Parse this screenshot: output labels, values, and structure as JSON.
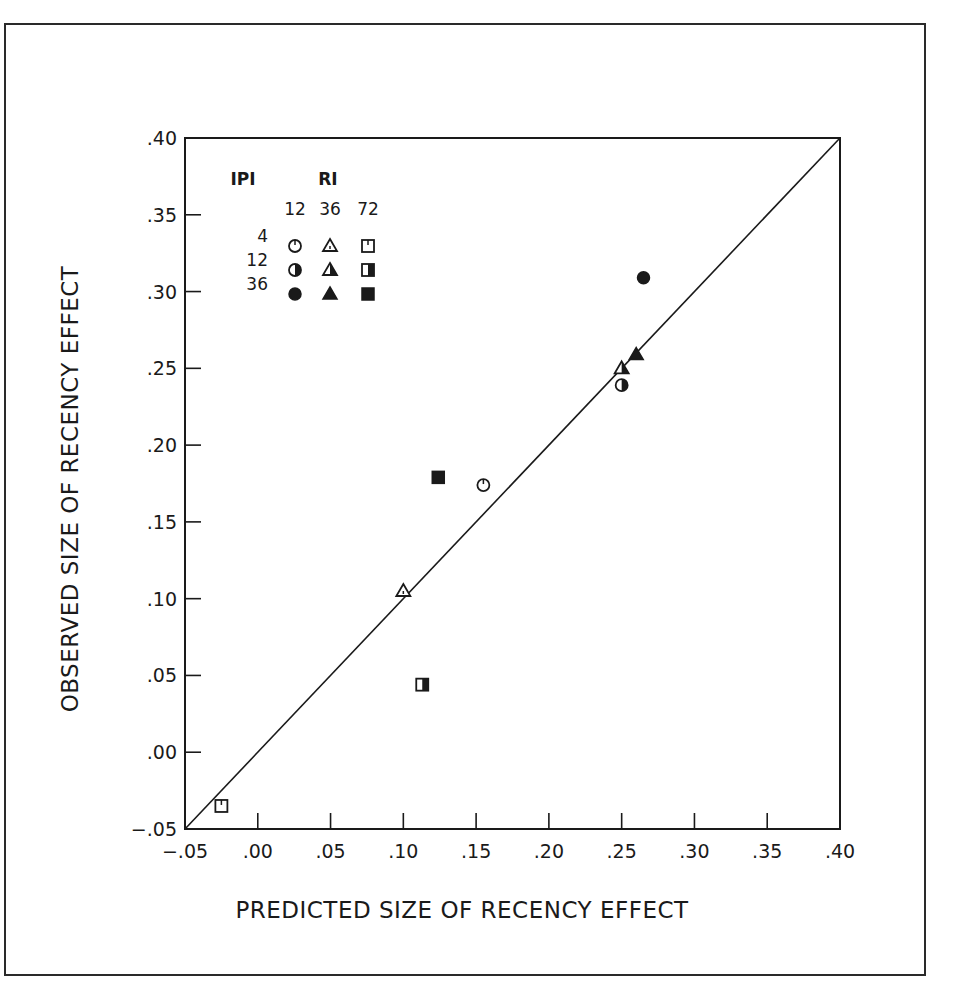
{
  "chart_data": {
    "type": "scatter",
    "title": "",
    "xlabel": "PREDICTED SIZE OF RECENCY EFFECT",
    "ylabel": "OBSERVED SIZE OF RECENCY EFFECT",
    "xlim": [
      -0.05,
      0.4
    ],
    "ylim": [
      -0.05,
      0.4
    ],
    "x_ticks": [
      "-.05",
      ".00",
      ".05",
      ".10",
      ".15",
      ".20",
      ".25",
      ".30",
      ".35",
      ".40"
    ],
    "y_ticks": [
      "-.05",
      ".00",
      ".05",
      ".10",
      ".15",
      ".20",
      ".25",
      ".30",
      ".35",
      ".40"
    ],
    "grid": false,
    "reference_line": {
      "type": "identity",
      "from": [
        -0.05,
        -0.05
      ],
      "to": [
        0.4,
        0.4
      ]
    },
    "legend": {
      "position": "upper-left inside plot",
      "row_header": "IPI",
      "col_header": "RI",
      "columns": [
        "12",
        "36",
        "72"
      ],
      "rows": [
        "4",
        "12",
        "36"
      ],
      "shape_by_RI": {
        "12": "circle",
        "36": "triangle",
        "72": "square"
      },
      "fill_by_IPI": {
        "4": "open",
        "12": "half",
        "36": "filled"
      }
    },
    "series": [
      {
        "name": "IPI 4, RI 12",
        "marker": "circle",
        "fill": "open",
        "x": 0.155,
        "y": 0.174
      },
      {
        "name": "IPI 4, RI 36",
        "marker": "triangle",
        "fill": "open",
        "x": 0.1,
        "y": 0.105
      },
      {
        "name": "IPI 4, RI 72",
        "marker": "square",
        "fill": "open",
        "x": -0.025,
        "y": -0.035
      },
      {
        "name": "IPI 12, RI 12",
        "marker": "circle",
        "fill": "half",
        "x": 0.25,
        "y": 0.239
      },
      {
        "name": "IPI 12, RI 36",
        "marker": "triangle",
        "fill": "half",
        "x": 0.25,
        "y": 0.25
      },
      {
        "name": "IPI 12, RI 72",
        "marker": "square",
        "fill": "half",
        "x": 0.113,
        "y": 0.044
      },
      {
        "name": "IPI 36, RI 12",
        "marker": "circle",
        "fill": "filled",
        "x": 0.265,
        "y": 0.309
      },
      {
        "name": "IPI 36, RI 36",
        "marker": "triangle",
        "fill": "filled",
        "x": 0.26,
        "y": 0.259
      },
      {
        "name": "IPI 36, RI 72",
        "marker": "square",
        "fill": "filled",
        "x": 0.124,
        "y": 0.179
      }
    ]
  },
  "colors": {
    "ink": "#1a1a1a",
    "background": "#ffffff"
  }
}
